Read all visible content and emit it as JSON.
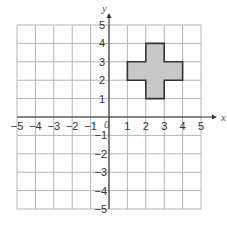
{
  "diagram": {
    "type": "coordinate-grid",
    "x_axis": {
      "label": "x",
      "min": -5,
      "max": 5,
      "ticks": [
        "−5",
        "−4",
        "−3",
        "−2",
        "−1",
        "1",
        "2",
        "3",
        "4",
        "5"
      ]
    },
    "y_axis": {
      "label": "y",
      "min": -5,
      "max": 5,
      "ticks_pos": [
        "1",
        "2",
        "3",
        "4",
        "5"
      ],
      "ticks_neg": [
        "−1",
        "−2",
        "−3",
        "−4",
        "−5"
      ]
    },
    "origin_label": "0",
    "shape": {
      "name": "cross",
      "fill": "#c8c8c8",
      "stroke": "#333333",
      "vertices": [
        [
          1,
          2
        ],
        [
          2,
          2
        ],
        [
          2,
          1
        ],
        [
          3,
          1
        ],
        [
          3,
          2
        ],
        [
          4,
          2
        ],
        [
          4,
          3
        ],
        [
          3,
          3
        ],
        [
          3,
          4
        ],
        [
          2,
          4
        ],
        [
          2,
          3
        ],
        [
          1,
          3
        ]
      ]
    },
    "colors": {
      "grid": "#b5b5b5",
      "axis": "#333333",
      "text": "#333333"
    }
  }
}
